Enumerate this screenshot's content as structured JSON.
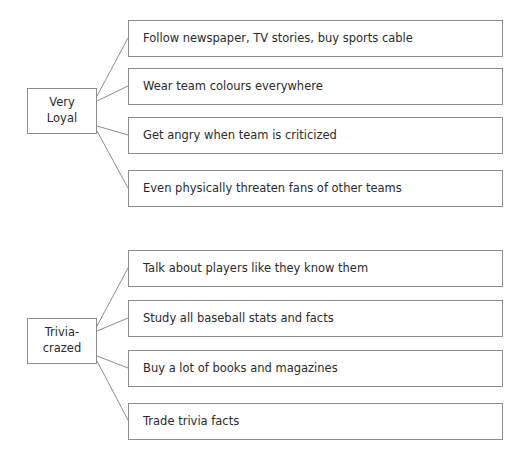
{
  "diagram": {
    "type": "tree-map",
    "orientation": "left-to-right",
    "background_color": "#ffffff",
    "line_color": "#8d8d8d",
    "text_color": "#2b2b2b",
    "clusters": [
      {
        "id": "very-loyal",
        "parent": {
          "label": "Very\nLoyal",
          "line1": "Very",
          "line2": "Loyal"
        },
        "children": [
          {
            "label": "Follow newspaper, TV stories, buy sports cable"
          },
          {
            "label": "Wear team colours everywhere"
          },
          {
            "label": "Get angry when team is criticized"
          },
          {
            "label": "Even physically threaten fans of other teams"
          }
        ]
      },
      {
        "id": "trivia-crazed",
        "parent": {
          "label": "Trivia-\ncrazed",
          "line1": "Trivia-",
          "line2": "crazed"
        },
        "children": [
          {
            "label": "Talk about players like they know them"
          },
          {
            "label": "Study all baseball stats and facts"
          },
          {
            "label": "Buy a lot of books and magazines"
          },
          {
            "label": "Trade trivia facts"
          }
        ]
      }
    ]
  }
}
